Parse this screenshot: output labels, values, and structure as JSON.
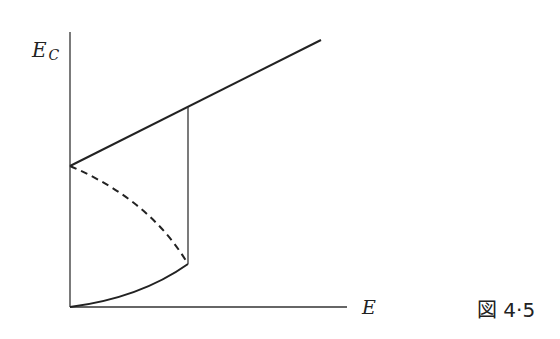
{
  "figure": {
    "caption": "図 4·5",
    "y_axis": {
      "label_main": "E",
      "label_sub": "C"
    },
    "x_axis": {
      "label": "E"
    }
  },
  "colors": {
    "ink": "#222222",
    "background": "#ffffff"
  }
}
